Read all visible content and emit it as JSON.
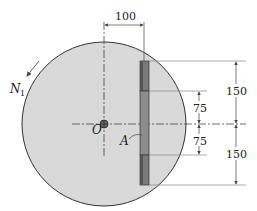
{
  "diagram": {
    "colors": {
      "disc_fill": "#d9d9d9",
      "disc_stroke": "#333333",
      "strip_dark": "#6f6f6f",
      "strip_mid": "#8a8a8a",
      "line": "#444444"
    },
    "labels": {
      "center": "O",
      "strip": "A",
      "normal": "N",
      "normal_subscript": "1"
    },
    "dimensions": {
      "offset": "100",
      "upper_outer": "150",
      "lower_outer": "150",
      "upper_inner": "75",
      "lower_inner": "75"
    }
  }
}
